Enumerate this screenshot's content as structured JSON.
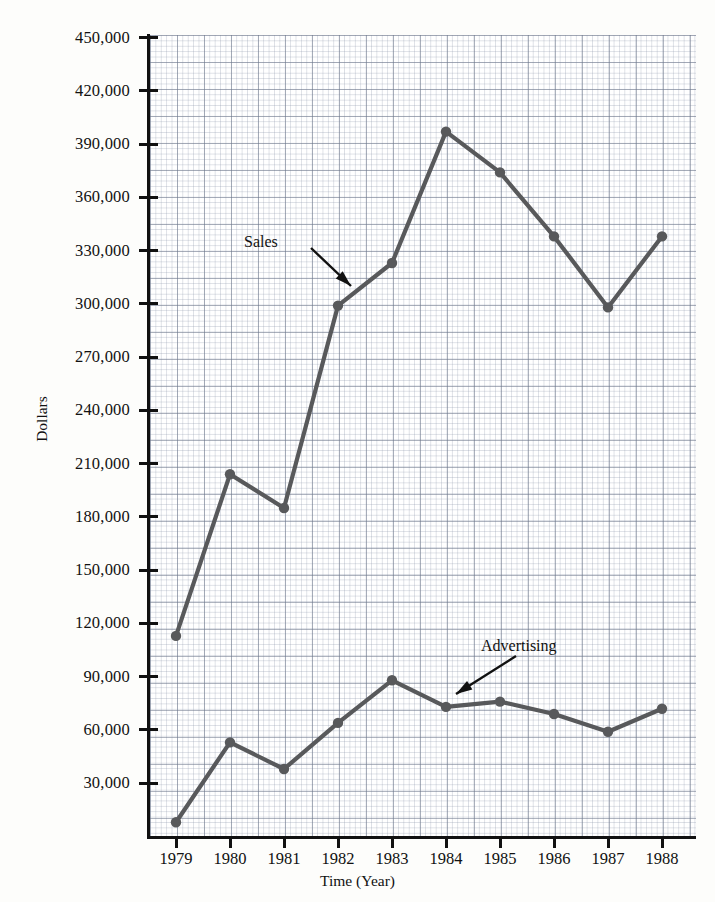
{
  "chart_data": {
    "type": "line",
    "title": "",
    "xlabel": "Time (Year)",
    "ylabel": "Dollars",
    "grid": true,
    "grid_style": "graph-paper",
    "legend_position": "inline-annotations",
    "x": [
      "1979",
      "1980",
      "1981",
      "1982",
      "1983",
      "1984",
      "1985",
      "1986",
      "1987",
      "1988"
    ],
    "categories": [
      "1979",
      "1980",
      "1981",
      "1982",
      "1983",
      "1984",
      "1985",
      "1986",
      "1987",
      "1988"
    ],
    "xlim": [
      "1979",
      "1988"
    ],
    "ylim": [
      0,
      450000
    ],
    "ytick_labels": [
      "450,000",
      "420,000",
      "390,000",
      "360,000",
      "330,000",
      "300,000",
      "270,000",
      "240,000",
      "210,000",
      "180,000",
      "150,000",
      "120,000",
      "90,000",
      "60,000",
      "30,000"
    ],
    "ytick_values": [
      450000,
      420000,
      390000,
      360000,
      330000,
      300000,
      270000,
      240000,
      210000,
      180000,
      150000,
      120000,
      90000,
      60000,
      30000
    ],
    "series": [
      {
        "name": "Sales",
        "color": "#58595b",
        "values": [
          113000,
          204000,
          185000,
          299000,
          323000,
          397000,
          374000,
          338000,
          298000,
          338000
        ]
      },
      {
        "name": "Advertising",
        "color": "#58595b",
        "values": [
          8000,
          53000,
          38000,
          64000,
          88000,
          73000,
          76000,
          69000,
          59000,
          72000
        ]
      }
    ],
    "annotations": [
      {
        "text": "Sales",
        "label_x": 273,
        "label_y": 244
      },
      {
        "text": "Advertising",
        "label_x": 527,
        "label_y": 648
      }
    ]
  },
  "axes": {
    "x_title": "Time (Year)",
    "y_title": "Dollars"
  }
}
